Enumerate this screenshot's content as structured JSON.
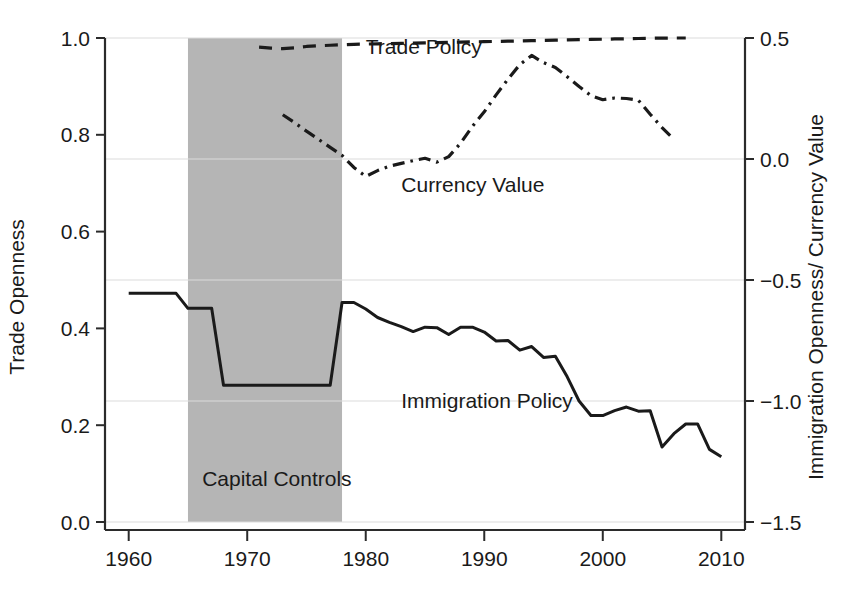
{
  "chart_data": {
    "type": "line",
    "title": "",
    "xlabel": "",
    "ylabel": "Trade Openness",
    "y2label": "Immigration Openness/ Currency Value",
    "xlim": [
      1958,
      2012
    ],
    "ylim": [
      0.0,
      1.0
    ],
    "y2lim": [
      -1.5,
      0.5
    ],
    "grid": true,
    "legend_position": "inline-annotations",
    "x_ticks": [
      1960,
      1970,
      1980,
      1990,
      2000,
      2010
    ],
    "x_tick_labels": [
      "1960",
      "1970",
      "1980",
      "1990",
      "2000",
      "2010"
    ],
    "y_ticks": [
      0.0,
      0.2,
      0.4,
      0.6,
      0.8,
      1.0
    ],
    "y_tick_labels": [
      "0.0",
      "0.2",
      "0.4",
      "0.6",
      "0.8",
      "1.0"
    ],
    "y2_ticks": [
      -1.5,
      -1.0,
      -0.5,
      0.0,
      0.5
    ],
    "y2_tick_labels": [
      "−1.5",
      "−1.0",
      "−0.5",
      "0.0",
      "0.5"
    ],
    "gridlines_y": [
      0.0,
      0.25,
      0.5,
      0.75,
      1.0
    ],
    "shaded_region": {
      "label": "Capital Controls",
      "x_start": 1965,
      "x_end": 1978,
      "color": "#b5b5b5",
      "label_x": 1966.2,
      "label_y": 0.075
    },
    "series": [
      {
        "name": "Trade Policy",
        "axis": "right",
        "style": "dashed",
        "color": "#1a1a1a",
        "annotation": "Trade Policy",
        "annotation_x": 1980.0,
        "annotation_y": 0.435,
        "x": [
          1971,
          1972,
          1973,
          1974,
          1975,
          1976,
          1977,
          1978,
          1979,
          1980,
          1981,
          1982,
          1983,
          1984,
          1985,
          1986,
          1987,
          1988,
          1989,
          1990,
          1991,
          1992,
          1993,
          1994,
          1995,
          1996,
          1997,
          1998,
          1999,
          2000,
          2001,
          2002,
          2003,
          2004,
          2005,
          2006,
          2007
        ],
        "y": [
          0.462,
          0.458,
          0.456,
          0.459,
          0.465,
          0.468,
          0.47,
          0.472,
          0.474,
          0.475,
          0.476,
          0.477,
          0.478,
          0.479,
          0.48,
          0.481,
          0.482,
          0.483,
          0.484,
          0.485,
          0.486,
          0.487,
          0.488,
          0.489,
          0.49,
          0.491,
          0.492,
          0.493,
          0.494,
          0.495,
          0.496,
          0.497,
          0.498,
          0.499,
          0.4995,
          0.5,
          0.5
        ]
      },
      {
        "name": "Currency Value",
        "axis": "right",
        "style": "dash-dot",
        "color": "#1a1a1a",
        "annotation": "Currency Value",
        "annotation_x": 1983.0,
        "annotation_y": -0.135,
        "x": [
          1973,
          1974,
          1975,
          1976,
          1977,
          1978,
          1979,
          1980,
          1981,
          1982,
          1983,
          1984,
          1985,
          1986,
          1987,
          1988,
          1989,
          1990,
          1991,
          1992,
          1993,
          1994,
          1995,
          1996,
          1997,
          1998,
          1999,
          2000,
          2001,
          2002,
          2003,
          2004,
          2005,
          2006
        ],
        "y": [
          0.183,
          0.15,
          0.115,
          0.082,
          0.048,
          0.015,
          -0.035,
          -0.072,
          -0.048,
          -0.03,
          -0.018,
          -0.007,
          0.003,
          -0.013,
          0.01,
          0.065,
          0.135,
          0.195,
          0.265,
          0.33,
          0.39,
          0.428,
          0.398,
          0.378,
          0.34,
          0.3,
          0.262,
          0.245,
          0.252,
          0.25,
          0.243,
          0.185,
          0.13,
          0.082
        ]
      },
      {
        "name": "Immigration Policy",
        "axis": "right",
        "style": "solid",
        "color": "#1a1a1a",
        "annotation": "Immigration Policy",
        "annotation_x": 1983.0,
        "annotation_y": -1.03,
        "x": [
          1960,
          1961,
          1962,
          1963,
          1964,
          1965,
          1966,
          1967,
          1968,
          1969,
          1970,
          1971,
          1972,
          1973,
          1974,
          1975,
          1976,
          1977,
          1978,
          1979,
          1980,
          1981,
          1982,
          1983,
          1984,
          1985,
          1986,
          1987,
          1988,
          1989,
          1990,
          1991,
          1992,
          1993,
          1994,
          1995,
          1996,
          1997,
          1998,
          1999,
          2000,
          2001,
          2002,
          2003,
          2004,
          2005,
          2006,
          2007,
          2008,
          2009,
          2010
        ],
        "y": [
          -0.555,
          -0.555,
          -0.555,
          -0.555,
          -0.555,
          -0.617,
          -0.617,
          -0.617,
          -0.935,
          -0.935,
          -0.935,
          -0.935,
          -0.935,
          -0.935,
          -0.935,
          -0.935,
          -0.935,
          -0.935,
          -0.593,
          -0.593,
          -0.62,
          -0.655,
          -0.675,
          -0.693,
          -0.713,
          -0.695,
          -0.697,
          -0.725,
          -0.695,
          -0.695,
          -0.715,
          -0.752,
          -0.75,
          -0.79,
          -0.775,
          -0.82,
          -0.815,
          -0.9,
          -1.0,
          -1.06,
          -1.06,
          -1.04,
          -1.025,
          -1.042,
          -1.04,
          -1.19,
          -1.135,
          -1.095,
          -1.095,
          -1.2,
          -1.23
        ]
      }
    ]
  },
  "axes": {
    "left_title": "Trade Openness",
    "right_title": "Immigration Openness/ Currency Value"
  }
}
